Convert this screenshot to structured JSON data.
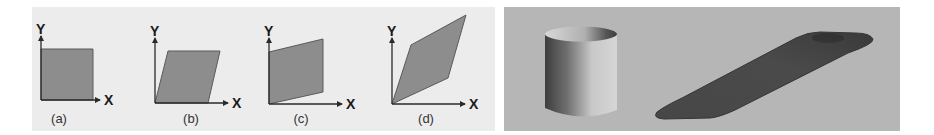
{
  "figure": {
    "left_panel": {
      "background": "#ececec",
      "shape_fill": "#8d8d8d",
      "shape_stroke": "#5a5a5a",
      "axis_color": "#2a2a2a",
      "subfigures": [
        {
          "id": "a",
          "caption": "(a)",
          "x_axis_label": "X",
          "y_axis_label": "Y",
          "transform": "none (square)",
          "origin": [
            41,
            100
          ],
          "shape_points": "41,100 93,100 93,49 41,49",
          "x_axis_end": 100,
          "y_axis_top": 36,
          "x_label_pos": [
            104,
            105
          ],
          "y_label_pos": [
            36,
            34
          ],
          "caption_pos": [
            59,
            123
          ]
        },
        {
          "id": "b",
          "caption": "(b)",
          "x_axis_label": "X",
          "y_axis_label": "Y",
          "transform": "shear along X",
          "origin": [
            155,
            103
          ],
          "shape_points": "155,103 208,103 220,51 168,51",
          "x_axis_end": 228,
          "y_axis_top": 38,
          "x_label_pos": [
            232,
            108
          ],
          "y_label_pos": [
            150,
            36
          ],
          "caption_pos": [
            191,
            123
          ]
        },
        {
          "id": "c",
          "caption": "(c)",
          "x_axis_label": "X",
          "y_axis_label": "Y",
          "transform": "shear along Y",
          "origin": [
            269,
            104
          ],
          "shape_points": "269,104 323,92 323,39 269,52",
          "x_axis_end": 342,
          "y_axis_top": 38,
          "x_label_pos": [
            346,
            109
          ],
          "y_label_pos": [
            264,
            36
          ],
          "caption_pos": [
            301,
            123
          ]
        },
        {
          "id": "d",
          "caption": "(d)",
          "x_axis_label": "X",
          "y_axis_label": "Y",
          "transform": "shear along X and Y",
          "origin": [
            392,
            104
          ],
          "shape_points": "392,104 448,78 466,15 411,45",
          "x_axis_end": 465,
          "y_axis_top": 38,
          "x_label_pos": [
            469,
            109
          ],
          "y_label_pos": [
            387,
            36
          ],
          "caption_pos": [
            426,
            123
          ]
        }
      ]
    },
    "right_panel": {
      "background": "#b6b6b6",
      "objects": [
        {
          "name": "cylinder",
          "description": "upright open cylinder, shaded 3D render"
        },
        {
          "name": "sheared-slab",
          "description": "flattened, sheared dark slab lying diagonally"
        }
      ],
      "cylinder_colors": {
        "dark": "#3e3e3e",
        "mid": "#8a8a8a",
        "light": "#d6d6d6",
        "rim_inner": "#cfcfcf",
        "rim_shadow": "#4a4a4a"
      },
      "slab_colors": {
        "body": "#444444",
        "edge": "#2f2f2f"
      }
    }
  }
}
